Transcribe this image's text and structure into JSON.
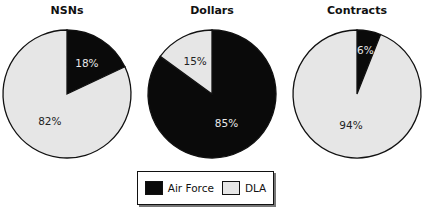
{
  "chart_data": [
    {
      "type": "pie",
      "title": "NSNs",
      "slices": [
        {
          "label": "Air Force",
          "value": 18,
          "text": "18%"
        },
        {
          "label": "DLA",
          "value": 82,
          "text": "82%"
        }
      ]
    },
    {
      "type": "pie",
      "title": "Dollars",
      "slices": [
        {
          "label": "Air Force",
          "value": 85,
          "text": "85%"
        },
        {
          "label": "DLA",
          "value": 15,
          "text": "15%"
        }
      ]
    },
    {
      "type": "pie",
      "title": "Contracts",
      "slices": [
        {
          "label": "Air Force",
          "value": 6,
          "text": "6%"
        },
        {
          "label": "DLA",
          "value": 94,
          "text": "94%"
        }
      ]
    }
  ],
  "legend": {
    "placement": "bottom-center",
    "items": [
      {
        "label": "Air Force",
        "color": "#0a0a0a"
      },
      {
        "label": "DLA",
        "color": "#e6e6e6"
      }
    ]
  },
  "colors": {
    "Air Force": "#0a0a0a",
    "DLA": "#e6e6e6",
    "outline": "#111111"
  }
}
